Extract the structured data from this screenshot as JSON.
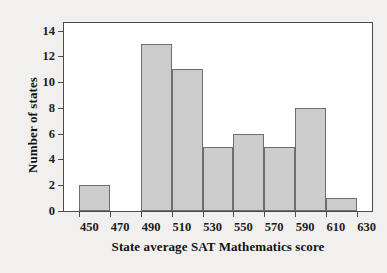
{
  "chart_data": {
    "type": "bar",
    "subtype": "histogram",
    "title": "",
    "xlabel": "State average SAT Mathematics score",
    "ylabel": "Number of states",
    "xlim": [
      440,
      640
    ],
    "ylim": [
      0,
      14.6
    ],
    "xticks": [
      450,
      470,
      490,
      510,
      530,
      550,
      570,
      590,
      610,
      630
    ],
    "yticks": [
      0,
      2,
      4,
      6,
      8,
      10,
      12,
      14
    ],
    "xtick_labels": [
      "450",
      "470",
      "490",
      "510",
      "530",
      "550",
      "570",
      "590",
      "610",
      "630"
    ],
    "ytick_labels": [
      "0",
      "2",
      "4",
      "6",
      "8",
      "10",
      "12",
      "14"
    ],
    "grid": false,
    "legend": null,
    "bin_width": 20,
    "bin_edges": [
      450,
      470,
      490,
      510,
      530,
      550,
      570,
      590,
      610,
      630
    ],
    "categories": [
      "450-470",
      "470-490",
      "490-510",
      "510-530",
      "530-550",
      "550-570",
      "570-590",
      "590-610",
      "610-630"
    ],
    "values": [
      2,
      0,
      13,
      11,
      5,
      6,
      5,
      8,
      1
    ],
    "bars": [
      {
        "label": "450-470",
        "start": 450,
        "end": 470,
        "value": 2
      },
      {
        "label": "470-490",
        "start": 470,
        "end": 490,
        "value": 0
      },
      {
        "label": "490-510",
        "start": 490,
        "end": 510,
        "value": 13
      },
      {
        "label": "510-530",
        "start": 510,
        "end": 530,
        "value": 11
      },
      {
        "label": "530-550",
        "start": 530,
        "end": 550,
        "value": 5
      },
      {
        "label": "550-570",
        "start": 550,
        "end": 570,
        "value": 6
      },
      {
        "label": "570-590",
        "start": 570,
        "end": 590,
        "value": 5
      },
      {
        "label": "590-610",
        "start": 590,
        "end": 610,
        "value": 8
      },
      {
        "label": "610-630",
        "start": 610,
        "end": 630,
        "value": 1
      }
    ],
    "colors": {
      "bar_fill": "#cccccc",
      "bar_edge": "#6e6e6e",
      "axis": "#4b4b4b",
      "text": "#121212",
      "plot_background": "#ffffff",
      "figure_background": "#f1f0ee"
    }
  }
}
